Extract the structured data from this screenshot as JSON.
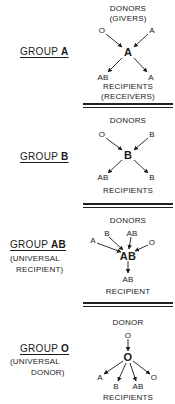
{
  "groups": [
    {
      "label_prefix": "GROUP ",
      "label_type": "A",
      "donors_header": "DONORS",
      "donors_subheader": "(GIVERS)",
      "donors": [
        "O",
        "A"
      ],
      "center": "A",
      "recipients": [
        "AB",
        "A"
      ],
      "recipients_header": "RECIPIENTS",
      "recipients_subheader": "(RECEIVERS)"
    },
    {
      "label_prefix": "GROUP ",
      "label_type": "B",
      "donors_header": "DONORS",
      "donors": [
        "O",
        "B"
      ],
      "center": "B",
      "recipients": [
        "AB",
        "B"
      ],
      "recipients_header": "RECIPIENTS"
    },
    {
      "label_prefix": "GROUP ",
      "label_type": "AB",
      "note_line1": "(UNIVERSAL",
      "note_line2": "RECIPIENT)",
      "donors_header": "DONORS",
      "donors": [
        "A",
        "B",
        "AB",
        "O"
      ],
      "center": "AB",
      "recipients": [
        "AB"
      ],
      "recipients_header": "RECIPIENT"
    },
    {
      "label_prefix": "GROUP ",
      "label_type": "O",
      "note_line1": "(UNIVERSAL",
      "note_line2": "DONOR)",
      "donors_header": "DONOR",
      "donors": [
        "O"
      ],
      "center": "O",
      "recipients": [
        "A",
        "B",
        "AB",
        "O"
      ],
      "recipients_header": "RECIPIENTS"
    }
  ],
  "colors": {
    "ink": "#1a1a1a",
    "background": "#ffffff"
  }
}
